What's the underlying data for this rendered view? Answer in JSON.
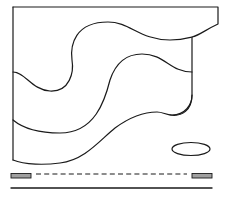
{
  "diagram": {
    "colors": {
      "stroke": "#1a1a1a",
      "bar_fill": "#a0a0a0",
      "background": "#ffffff"
    },
    "shapes": {
      "outer_boundary": "M13,7 L218,7 L218,24 C205,30 200,35 192,37 L192,95 C192,110 182,117 170,115",
      "curve_top": "M13,72 C25,72 32,90 50,91 C70,92 74,72 72,60 C70,45 75,22 108,22 C130,22 140,40 170,40 C182,40 188,38 192,37",
      "curve_middle": "M13,120 C25,130 40,133 60,133 C95,133 105,100 110,80 C115,65 125,54 142,54 C165,54 170,72 192,72",
      "curve_bottom": "M13,160 C25,165 45,165 60,163 C85,160 100,140 115,128 C130,117 145,112 157,112 C163,112 166,115 172,115 C185,115 192,105 192,95",
      "left_edge": "M13,7 L13,160",
      "ellipse": {
        "cx": 191,
        "cy": 149,
        "rx": 19,
        "ry": 6.5
      },
      "left_bar": {
        "x": 11,
        "y": 173.5,
        "w": 20,
        "h": 4.5
      },
      "right_bar": {
        "x": 192,
        "y": 173.5,
        "w": 20,
        "h": 4.5
      },
      "dashed_line": {
        "x1": 36,
        "y1": 174,
        "x2": 187,
        "y2": 174
      },
      "base_line": {
        "x1": 11,
        "y1": 188,
        "x2": 212,
        "y2": 188
      }
    }
  }
}
